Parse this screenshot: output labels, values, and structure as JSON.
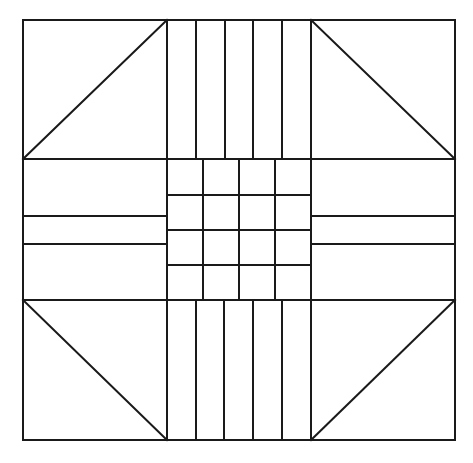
{
  "diagram": {
    "background": "#ffffff",
    "stroke": "#1a1a1a",
    "outer": {
      "x1": 23,
      "y1": 20,
      "x2": 455,
      "y2": 440
    },
    "block_cols": [
      23,
      167,
      311,
      455
    ],
    "block_rows": [
      20,
      159,
      300,
      440
    ],
    "corners": [
      {
        "name": "top-left",
        "diagonal": [
          23,
          159,
          167,
          20
        ]
      },
      {
        "name": "top-right",
        "diagonal": [
          311,
          20,
          455,
          159
        ]
      },
      {
        "name": "bottom-left",
        "diagonal": [
          23,
          300,
          167,
          440
        ]
      },
      {
        "name": "bottom-right",
        "diagonal": [
          311,
          440,
          455,
          300
        ]
      }
    ],
    "top_band_strips_x": [
      196,
      225,
      253,
      282
    ],
    "bottom_band_strips_x": [
      196,
      224,
      253,
      282
    ],
    "left_band_strips_y": [
      216,
      244
    ],
    "right_band_strips_y": [
      216,
      244
    ],
    "center_grid": {
      "cols": [
        167,
        203,
        239,
        275,
        311
      ],
      "rows": [
        159,
        195,
        230,
        265,
        300
      ],
      "size": "4x4"
    }
  }
}
